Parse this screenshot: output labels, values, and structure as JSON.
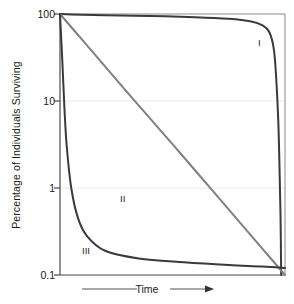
{
  "chart_data": {
    "type": "line",
    "title": "",
    "xlabel": "Time",
    "ylabel": "Percentage of Individuals Surviving",
    "yscale": "log",
    "ylim": [
      0.1,
      100
    ],
    "xlim": [
      0,
      100
    ],
    "grid": true,
    "grid_axis": "y",
    "legend_position": "inline-curve-labels",
    "ytick_labels": [
      "100",
      "10",
      "1",
      "0.1"
    ],
    "ytick_values": [
      100,
      10,
      1,
      0.1
    ],
    "xtick_labels": [],
    "series": [
      {
        "name": "I",
        "label": "I",
        "color": "#3a3a3a",
        "description": "Type I survivorship: high survival through most of life, steep drop late",
        "x": [
          0,
          5,
          20,
          40,
          60,
          75,
          85,
          90,
          93,
          95,
          96,
          97,
          97.5,
          98,
          98.3
        ],
        "values": [
          100,
          99,
          97,
          95,
          92,
          88,
          82,
          74,
          62,
          40,
          20,
          6,
          2,
          0.5,
          0.1
        ]
      },
      {
        "name": "II",
        "label": "II",
        "color": "#808080",
        "description": "Type II survivorship: constant mortality rate, straight line on log scale",
        "x": [
          0,
          10,
          20,
          30,
          40,
          50,
          60,
          70,
          80,
          90,
          100
        ],
        "values": [
          100,
          50,
          25,
          12.5,
          6.3,
          3.2,
          1.6,
          0.8,
          0.4,
          0.2,
          0.1
        ]
      },
      {
        "name": "III",
        "label": "III",
        "color": "#3a3a3a",
        "description": "Type III survivorship: very high early mortality, then high survival",
        "x": [
          0,
          1,
          2,
          3,
          5,
          8,
          12,
          20,
          35,
          55,
          75,
          90,
          100
        ],
        "values": [
          100,
          30,
          8,
          3,
          1,
          0.45,
          0.28,
          0.19,
          0.155,
          0.14,
          0.13,
          0.125,
          0.12
        ]
      }
    ]
  },
  "axis": {
    "x_label_text": "Time",
    "y_label_text": "Percentage of Individuals Surviving"
  },
  "curve_labels": {
    "one": "I",
    "two": "II",
    "three": "III"
  },
  "colors": {
    "curve_dark": "#3a3a3a",
    "curve_gray": "#808080",
    "frame": "#6e6e6e",
    "grid": "#eaeaea",
    "text": "#1a1a1a"
  }
}
